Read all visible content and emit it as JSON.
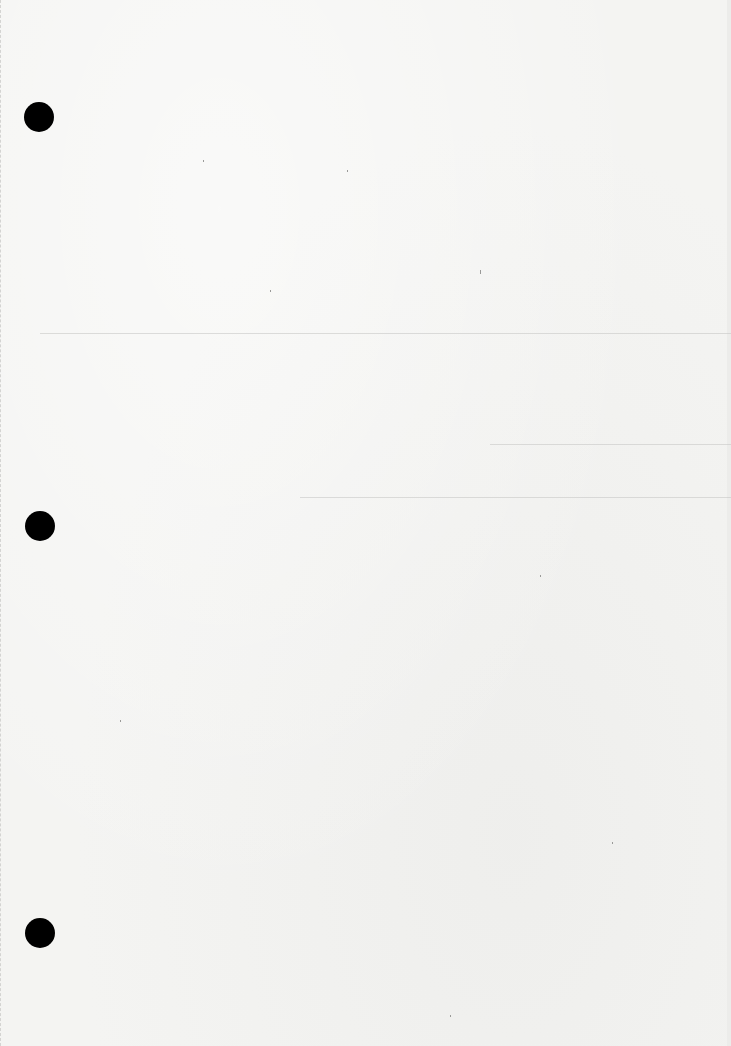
{
  "document": {
    "type": "blank scanned page",
    "punch_holes": 3,
    "content": ""
  },
  "colors": {
    "paper": "#f4f4f2",
    "hole": "#000000"
  }
}
